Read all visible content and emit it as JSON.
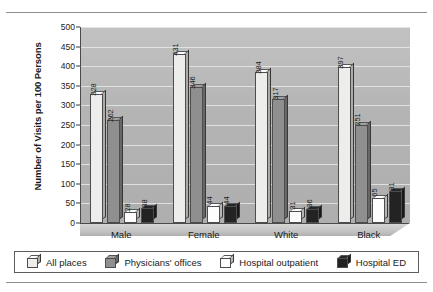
{
  "chart_data": {
    "type": "bar",
    "title": "",
    "subtitle": "",
    "xlabel": "",
    "ylabel": "Number of Visits per 100 Persons",
    "ylim": [
      0,
      500
    ],
    "yticks": [
      0,
      50,
      100,
      150,
      200,
      250,
      300,
      350,
      400,
      450,
      500
    ],
    "ytick_labels": [
      "0",
      "50",
      "100",
      "150",
      "200",
      "250",
      "300",
      "350",
      "400",
      "450",
      "500"
    ],
    "grid": true,
    "legend_position": "bottom",
    "categories": [
      "Male",
      "Female",
      "White",
      "Black"
    ],
    "series": [
      {
        "name": "All places",
        "color": "#ededeb",
        "values": [
          328,
          431,
          384,
          397
        ],
        "labels": [
          "328",
          "431",
          "384",
          "397"
        ]
      },
      {
        "name": "Physicians' offices",
        "color": "#8f8f8f",
        "values": [
          262,
          346,
          317,
          251
        ],
        "labels": [
          "262",
          "346",
          "317",
          "251"
        ]
      },
      {
        "name": "Hospital outpatient",
        "color": "#fdfdfd",
        "values": [
          28,
          44,
          31,
          65
        ],
        "labels": [
          "28",
          "44",
          "31",
          "65"
        ]
      },
      {
        "name": "Hospital ED",
        "color": "#232323",
        "values": [
          38,
          44,
          36,
          81
        ],
        "labels": [
          "38",
          "44",
          "36",
          "81"
        ]
      }
    ]
  },
  "legend": {
    "items": [
      {
        "label": "All places",
        "color": "#ededeb"
      },
      {
        "label": "Physicians' offices",
        "color": "#8f8f8f"
      },
      {
        "label": "Hospital outpatient",
        "color": "#fdfdfd"
      },
      {
        "label": "Hospital ED",
        "color": "#232323"
      }
    ]
  }
}
